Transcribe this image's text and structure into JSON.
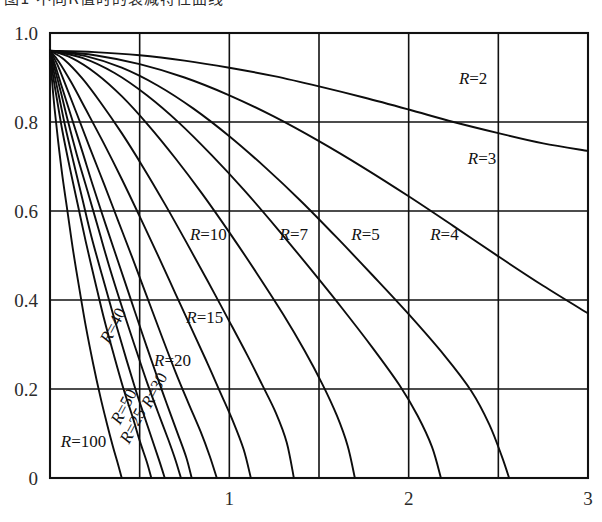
{
  "figure": {
    "caption_cut_off": "图1 不同R值时的衰减特性曲线",
    "name": "decay-curve-family"
  },
  "chart_data": {
    "type": "line",
    "title": "",
    "subtitle": "",
    "xlabel": "",
    "ylabel": "",
    "xlim": [
      0,
      3
    ],
    "ylim": [
      0,
      1.0
    ],
    "grid": true,
    "grid_x_step": 0.5,
    "grid_y_step": 0.2,
    "legend_position": "inline-labels",
    "x_ticks": [
      1,
      2,
      3
    ],
    "x_tick_labels": [
      "1",
      "2",
      "3"
    ],
    "x_minor_gridlines": [
      0.5,
      1.5,
      2.5
    ],
    "y_ticks": [
      0,
      0.2,
      0.4,
      0.6,
      0.8,
      1.0
    ],
    "y_tick_labels": [
      "0",
      "0.2",
      "0.4",
      "0.6",
      "0.8",
      "1.0"
    ],
    "common_start_point": [
      0,
      0.96
    ],
    "series": [
      {
        "name": "R=2",
        "label": "R=2",
        "label_position": [
          2.28,
          0.885
        ],
        "points": [
          [
            0.0,
            0.96
          ],
          [
            0.25,
            0.957
          ],
          [
            0.5,
            0.95
          ],
          [
            0.75,
            0.938
          ],
          [
            1.0,
            0.922
          ],
          [
            1.25,
            0.903
          ],
          [
            1.5,
            0.88
          ],
          [
            1.75,
            0.855
          ],
          [
            2.0,
            0.828
          ],
          [
            2.25,
            0.8
          ],
          [
            2.5,
            0.775
          ],
          [
            2.75,
            0.752
          ],
          [
            3.0,
            0.735
          ]
        ]
      },
      {
        "name": "R=3",
        "label": "R=3",
        "label_position": [
          2.33,
          0.705
        ],
        "points": [
          [
            0.0,
            0.96
          ],
          [
            0.25,
            0.95
          ],
          [
            0.5,
            0.93
          ],
          [
            0.75,
            0.9
          ],
          [
            1.0,
            0.86
          ],
          [
            1.25,
            0.812
          ],
          [
            1.5,
            0.757
          ],
          [
            1.75,
            0.697
          ],
          [
            2.0,
            0.633
          ],
          [
            2.25,
            0.566
          ],
          [
            2.5,
            0.498
          ],
          [
            2.75,
            0.432
          ],
          [
            3.0,
            0.37
          ]
        ]
      },
      {
        "name": "R=4",
        "label": "R=4",
        "label_position": [
          2.12,
          0.535
        ],
        "points": [
          [
            0.0,
            0.96
          ],
          [
            0.2,
            0.948
          ],
          [
            0.4,
            0.922
          ],
          [
            0.6,
            0.882
          ],
          [
            0.8,
            0.83
          ],
          [
            1.0,
            0.768
          ],
          [
            1.2,
            0.698
          ],
          [
            1.4,
            0.622
          ],
          [
            1.6,
            0.54
          ],
          [
            1.8,
            0.455
          ],
          [
            2.0,
            0.368
          ],
          [
            2.2,
            0.275
          ],
          [
            2.35,
            0.195
          ],
          [
            2.45,
            0.12
          ],
          [
            2.52,
            0.048
          ],
          [
            2.56,
            0.0
          ]
        ]
      },
      {
        "name": "R=5",
        "label": "R=5",
        "label_position": [
          1.68,
          0.535
        ],
        "points": [
          [
            0.0,
            0.96
          ],
          [
            0.18,
            0.944
          ],
          [
            0.36,
            0.91
          ],
          [
            0.54,
            0.86
          ],
          [
            0.72,
            0.798
          ],
          [
            0.9,
            0.726
          ],
          [
            1.08,
            0.648
          ],
          [
            1.26,
            0.564
          ],
          [
            1.44,
            0.476
          ],
          [
            1.62,
            0.386
          ],
          [
            1.8,
            0.292
          ],
          [
            1.95,
            0.208
          ],
          [
            2.05,
            0.14
          ],
          [
            2.13,
            0.07
          ],
          [
            2.18,
            0.0
          ]
        ]
      },
      {
        "name": "R=7",
        "label": "R=7",
        "label_position": [
          1.28,
          0.535
        ],
        "points": [
          [
            0.0,
            0.96
          ],
          [
            0.12,
            0.944
          ],
          [
            0.26,
            0.908
          ],
          [
            0.4,
            0.858
          ],
          [
            0.55,
            0.792
          ],
          [
            0.7,
            0.718
          ],
          [
            0.85,
            0.638
          ],
          [
            1.0,
            0.552
          ],
          [
            1.15,
            0.462
          ],
          [
            1.3,
            0.368
          ],
          [
            1.42,
            0.286
          ],
          [
            1.52,
            0.21
          ],
          [
            1.6,
            0.14
          ],
          [
            1.66,
            0.072
          ],
          [
            1.7,
            0.0
          ]
        ]
      },
      {
        "name": "R=10",
        "label": "R=10",
        "label_position": [
          0.78,
          0.535
        ],
        "points": [
          [
            0.0,
            0.96
          ],
          [
            0.08,
            0.94
          ],
          [
            0.18,
            0.898
          ],
          [
            0.28,
            0.845
          ],
          [
            0.4,
            0.775
          ],
          [
            0.52,
            0.698
          ],
          [
            0.64,
            0.616
          ],
          [
            0.76,
            0.53
          ],
          [
            0.88,
            0.442
          ],
          [
            1.0,
            0.352
          ],
          [
            1.1,
            0.276
          ],
          [
            1.18,
            0.212
          ],
          [
            1.26,
            0.146
          ],
          [
            1.32,
            0.08
          ],
          [
            1.36,
            0.0
          ]
        ]
      },
      {
        "name": "R=15",
        "label": "R=15",
        "label_position": [
          0.76,
          0.348
        ],
        "points": [
          [
            0.0,
            0.96
          ],
          [
            0.05,
            0.935
          ],
          [
            0.12,
            0.888
          ],
          [
            0.2,
            0.828
          ],
          [
            0.3,
            0.752
          ],
          [
            0.4,
            0.672
          ],
          [
            0.5,
            0.588
          ],
          [
            0.6,
            0.502
          ],
          [
            0.7,
            0.414
          ],
          [
            0.8,
            0.326
          ],
          [
            0.88,
            0.256
          ],
          [
            0.95,
            0.192
          ],
          [
            1.02,
            0.128
          ],
          [
            1.08,
            0.064
          ],
          [
            1.12,
            0.0
          ]
        ]
      },
      {
        "name": "R=20",
        "label": "R=20",
        "label_position": [
          0.58,
          0.252
        ],
        "points": [
          [
            0.0,
            0.96
          ],
          [
            0.04,
            0.93
          ],
          [
            0.09,
            0.88
          ],
          [
            0.15,
            0.818
          ],
          [
            0.22,
            0.744
          ],
          [
            0.3,
            0.662
          ],
          [
            0.38,
            0.578
          ],
          [
            0.46,
            0.494
          ],
          [
            0.54,
            0.408
          ],
          [
            0.62,
            0.322
          ],
          [
            0.7,
            0.238
          ],
          [
            0.77,
            0.17
          ],
          [
            0.84,
            0.104
          ],
          [
            0.89,
            0.05
          ],
          [
            0.93,
            0.0
          ]
        ]
      },
      {
        "name": "R=25",
        "label": "R=25",
        "label_position": [
          0.44,
          0.075
        ],
        "label_rotation": -62,
        "points": [
          [
            0.0,
            0.96
          ],
          [
            0.03,
            0.926
          ],
          [
            0.07,
            0.874
          ],
          [
            0.12,
            0.81
          ],
          [
            0.18,
            0.734
          ],
          [
            0.24,
            0.656
          ],
          [
            0.31,
            0.57
          ],
          [
            0.38,
            0.486
          ],
          [
            0.45,
            0.402
          ],
          [
            0.52,
            0.318
          ],
          [
            0.59,
            0.236
          ],
          [
            0.65,
            0.168
          ],
          [
            0.71,
            0.102
          ],
          [
            0.76,
            0.046
          ],
          [
            0.79,
            0.0
          ]
        ]
      },
      {
        "name": "R=30",
        "label": "R=30",
        "label_position": [
          0.56,
          0.155
        ],
        "label_rotation": -62,
        "points": [
          [
            0.0,
            0.96
          ],
          [
            0.025,
            0.922
          ],
          [
            0.06,
            0.868
          ],
          [
            0.1,
            0.802
          ],
          [
            0.15,
            0.726
          ],
          [
            0.21,
            0.644
          ],
          [
            0.27,
            0.56
          ],
          [
            0.33,
            0.476
          ],
          [
            0.4,
            0.386
          ],
          [
            0.47,
            0.3
          ],
          [
            0.54,
            0.216
          ],
          [
            0.6,
            0.15
          ],
          [
            0.66,
            0.086
          ],
          [
            0.7,
            0.04
          ],
          [
            0.73,
            0.0
          ]
        ]
      },
      {
        "name": "R=40",
        "label": "R=40",
        "label_position": [
          0.33,
          0.3
        ],
        "label_rotation": -62,
        "points": [
          [
            0.0,
            0.96
          ],
          [
            0.02,
            0.916
          ],
          [
            0.05,
            0.858
          ],
          [
            0.085,
            0.79
          ],
          [
            0.13,
            0.712
          ],
          [
            0.18,
            0.628
          ],
          [
            0.23,
            0.544
          ],
          [
            0.29,
            0.456
          ],
          [
            0.35,
            0.37
          ],
          [
            0.41,
            0.288
          ],
          [
            0.47,
            0.208
          ],
          [
            0.52,
            0.146
          ],
          [
            0.57,
            0.086
          ],
          [
            0.61,
            0.038
          ],
          [
            0.64,
            0.0
          ]
        ]
      },
      {
        "name": "R=50",
        "label": "R=50",
        "label_position": [
          0.39,
          0.118
        ],
        "label_rotation": -62,
        "points": [
          [
            0.0,
            0.96
          ],
          [
            0.015,
            0.91
          ],
          [
            0.04,
            0.848
          ],
          [
            0.07,
            0.778
          ],
          [
            0.11,
            0.698
          ],
          [
            0.155,
            0.614
          ],
          [
            0.2,
            0.53
          ],
          [
            0.25,
            0.444
          ],
          [
            0.3,
            0.36
          ],
          [
            0.355,
            0.278
          ],
          [
            0.41,
            0.2
          ],
          [
            0.46,
            0.138
          ],
          [
            0.5,
            0.084
          ],
          [
            0.54,
            0.036
          ],
          [
            0.565,
            0.0
          ]
        ]
      },
      {
        "name": "R=100",
        "label": "R=100",
        "label_position": [
          0.06,
          0.07
        ],
        "points": [
          [
            0.0,
            0.96
          ],
          [
            0.01,
            0.9
          ],
          [
            0.025,
            0.832
          ],
          [
            0.045,
            0.758
          ],
          [
            0.07,
            0.676
          ],
          [
            0.1,
            0.592
          ],
          [
            0.13,
            0.508
          ],
          [
            0.165,
            0.422
          ],
          [
            0.2,
            0.34
          ],
          [
            0.24,
            0.258
          ],
          [
            0.28,
            0.184
          ],
          [
            0.315,
            0.126
          ],
          [
            0.35,
            0.072
          ],
          [
            0.38,
            0.03
          ],
          [
            0.4,
            0.0
          ]
        ]
      }
    ]
  },
  "plot_geometry": {
    "left": 50,
    "right": 588,
    "top": 33,
    "bottom": 478
  },
  "colors": {
    "curve": "#0d0d0d",
    "grid": "#111111",
    "frame": "#111111",
    "text": "#2b2b2b",
    "background": "#ffffff"
  }
}
